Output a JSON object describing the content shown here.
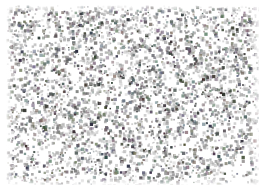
{
  "image": {
    "kind": "grayscale-speckle-texture",
    "caption": "",
    "width": 265,
    "height": 190,
    "background_color": "#ffffff",
    "margins": {
      "left": 6,
      "top": 5,
      "right": 6,
      "bottom": 5
    },
    "texture_area": {
      "width": 253,
      "height": 180
    },
    "grain": {
      "palette": [
        "#ffffff",
        "#f2f2f2",
        "#d9d9d9",
        "#bfbfbf",
        "#a6a6a6",
        "#8c8c8c",
        "#737373",
        "#595959",
        "#404040"
      ],
      "dominant_color": "#ffffff",
      "speckle_color": "#6e6e6e",
      "darkest_color": "#3a3a3a",
      "coverage_percent": 34,
      "grain_size_px": 2,
      "cluster_size_px": 5,
      "density_note": "uniform random speckle, slightly sparser near the bottom edge"
    },
    "chart_data": {
      "type": "heatmap",
      "title": "",
      "xlabel": "",
      "ylabel": "",
      "grid": false,
      "legend": "none",
      "xlim": [
        0,
        253
      ],
      "ylim": [
        0,
        180
      ],
      "description": "Dense random grayscale speckle field (film-grain / micrograph-like noise) covering the full plotting area on a white ground.",
      "value_range": [
        0,
        255
      ],
      "mean_intensity": 228,
      "std_intensity": 38
    }
  }
}
